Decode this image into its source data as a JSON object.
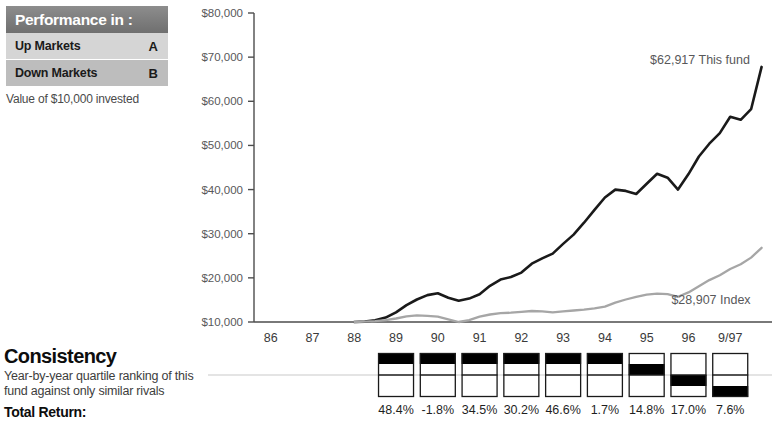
{
  "performance_box": {
    "header_title": "Performance in :",
    "rows": [
      {
        "label": "Up Markets",
        "grade": "A"
      },
      {
        "label": "Down Markets",
        "grade": "B"
      }
    ],
    "caption": "Value of $10,000 invested",
    "header_bg": "#7a7a7a",
    "row_light_bg": "#d5d5d5",
    "row_dark_bg": "#bdbdbd"
  },
  "consistency": {
    "title": "Consistency",
    "description_line1": "Year-by-year quartile ranking of this",
    "description_line2": "fund against only similar rivals",
    "total_return_label": "Total Return:"
  },
  "chart_data": {
    "type": "line",
    "title": "",
    "xlabel": "",
    "ylabel": "",
    "ylim": [
      10000,
      80000
    ],
    "grid": false,
    "legend_position": "inline-annotation",
    "y_ticks": [
      10000,
      20000,
      30000,
      40000,
      50000,
      60000,
      70000,
      80000
    ],
    "y_tick_labels": [
      "$10,000",
      "$20,000",
      "$30,000",
      "$40,000",
      "$50,000",
      "$60,000",
      "$70,000",
      "$80,000"
    ],
    "x_tick_labels": [
      "86",
      "87",
      "88",
      "89",
      "90",
      "91",
      "92",
      "93",
      "94",
      "95",
      "96",
      "9/97"
    ],
    "annotations": [
      {
        "text": "$62,917 This fund",
        "value": 62917,
        "series": "This fund"
      },
      {
        "text": "$28,907 Index",
        "value": 28907,
        "series": "Index"
      }
    ],
    "series": [
      {
        "name": "This fund",
        "color": "#1a1a1a",
        "x": [
          88.0,
          88.25,
          88.5,
          88.75,
          89.0,
          89.25,
          89.5,
          89.75,
          90.0,
          90.25,
          90.5,
          90.75,
          91.0,
          91.25,
          91.5,
          91.75,
          92.0,
          92.25,
          92.5,
          92.75,
          93.0,
          93.25,
          93.5,
          93.75,
          94.0,
          94.25,
          94.5,
          94.75,
          95.0,
          95.25,
          95.5,
          95.75,
          96.0,
          96.25,
          96.5,
          96.75,
          97.0,
          97.25,
          97.5,
          97.75
        ],
        "values": [
          10000,
          10100,
          10400,
          11000,
          12200,
          13800,
          15100,
          16100,
          16500,
          15500,
          14800,
          15300,
          16300,
          18200,
          19600,
          20200,
          21200,
          23200,
          24400,
          25500,
          27700,
          29800,
          32500,
          35400,
          38200,
          40000,
          39700,
          39000,
          41300,
          43600,
          42700,
          40000,
          43500,
          47500,
          50400,
          52800,
          56500,
          55800,
          58200,
          67800
        ]
      },
      {
        "name": "Index",
        "color": "#a6a6a6",
        "x": [
          88.0,
          88.25,
          88.5,
          88.75,
          89.0,
          89.25,
          89.5,
          89.75,
          90.0,
          90.25,
          90.5,
          90.75,
          91.0,
          91.25,
          91.5,
          91.75,
          92.0,
          92.25,
          92.5,
          92.75,
          93.0,
          93.25,
          93.5,
          93.75,
          94.0,
          94.25,
          94.5,
          94.75,
          95.0,
          95.25,
          95.5,
          95.75,
          96.0,
          96.25,
          96.5,
          96.75,
          97.0,
          97.25,
          97.5,
          97.75
        ],
        "values": [
          10000,
          10100,
          10200,
          10400,
          10800,
          11300,
          11500,
          11400,
          11200,
          10600,
          10000,
          10400,
          11200,
          11700,
          12000,
          12100,
          12300,
          12500,
          12400,
          12200,
          12400,
          12600,
          12800,
          13100,
          13500,
          14400,
          15100,
          15700,
          16200,
          16400,
          16300,
          15700,
          16700,
          18100,
          19500,
          20600,
          22000,
          23100,
          24600,
          26800
        ]
      }
    ]
  },
  "quartile_ranking": {
    "years": [
      "89",
      "90",
      "91",
      "92",
      "93",
      "94",
      "95",
      "96",
      "9/97"
    ],
    "quartiles": [
      1,
      1,
      1,
      1,
      1,
      1,
      2,
      3,
      4
    ],
    "returns": [
      "48.4%",
      "-1.8%",
      "34.5%",
      "30.2%",
      "46.6%",
      "1.7%",
      "14.8%",
      "17.0%",
      "7.6%"
    ],
    "fill_color": "#000000",
    "box_border_color": "#1a1a1a",
    "divider_color": "#c9c9c9"
  }
}
